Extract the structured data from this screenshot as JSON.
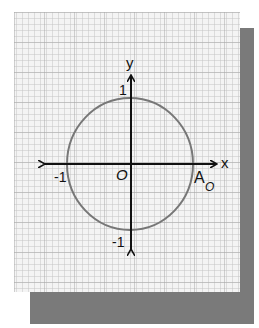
{
  "figure": {
    "colors": {
      "paper": "#f4f4f4",
      "grid_line": "#bdbdbd",
      "shadow": "#7a7a7a",
      "axis": "#111111",
      "circle": "#777777"
    },
    "axes": {
      "x_label": "x",
      "y_label": "y",
      "origin_label": "O"
    },
    "ticks": {
      "y_pos": "1",
      "y_neg": "-1",
      "x_neg": "-1"
    },
    "point": {
      "name": "A",
      "subscript": "O"
    },
    "circle": {
      "center": [
        0,
        0
      ],
      "radius": 1
    }
  }
}
